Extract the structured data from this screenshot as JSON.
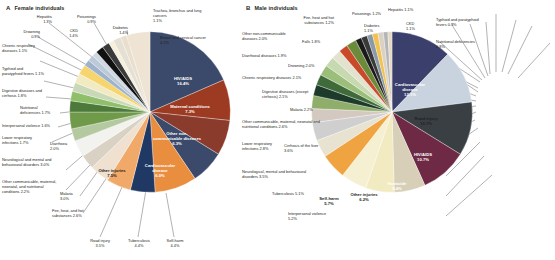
{
  "figure": {
    "panels": [
      {
        "letter": "A",
        "title": "Female individuals",
        "inner_labels": [
          {
            "name": "HIV/AIDS",
            "value": "16.4%"
          },
          {
            "name": "Maternal conditions",
            "value": "7.3%"
          },
          {
            "name": "Other non-communicable diseases",
            "value": "6.3%"
          },
          {
            "name": "Cardiovascular disease",
            "value": "6.0%"
          },
          {
            "name": "Other injuries",
            "value": "7.5%"
          }
        ],
        "outer_labels": [
          {
            "name": "Hepatitis",
            "value": "1.3%"
          },
          {
            "name": "Poisonings",
            "value": "0.9%"
          },
          {
            "name": "Trachea, bronchus and lung cancers",
            "value": "1.1%"
          },
          {
            "name": "Diabetes",
            "value": "1.4%"
          },
          {
            "name": "Breast and cervical cancer",
            "value": "4.2%"
          },
          {
            "name": "CKD",
            "value": "1.4%"
          },
          {
            "name": "Drowning",
            "value": "0.9%"
          },
          {
            "name": "Chronic respiratory diseases",
            "value": "1.1%"
          },
          {
            "name": "Typhoid and paratyphoid fevers",
            "value": "1.1%"
          },
          {
            "name": "Digestive diseases and cirrhosis",
            "value": "1.8%"
          },
          {
            "name": "Nutritional deficiencies",
            "value": "1.7%"
          },
          {
            "name": "Interpersonal violence",
            "value": "1.6%"
          },
          {
            "name": "Lower respiratory infections",
            "value": "1.7%"
          },
          {
            "name": "Diarrhoea",
            "value": "2.0%"
          },
          {
            "name": "Neurological and mental and behavioural disorders",
            "value": "3.0%"
          },
          {
            "name": "Other communicable, maternal, neonatal, and nutritional conditions",
            "value": "2.2%"
          },
          {
            "name": "Malaria",
            "value": "3.0%"
          },
          {
            "name": "Fire, heat, and hot substances",
            "value": "2.6%"
          },
          {
            "name": "Road injury",
            "value": "3.5%"
          },
          {
            "name": "Tuberculosis",
            "value": "4.4%"
          },
          {
            "name": "Self-harm",
            "value": "4.4%"
          }
        ]
      },
      {
        "letter": "B",
        "title": "Male individuals",
        "inner_labels": [
          {
            "name": "Cardiovascular disease",
            "value": "12.1%"
          },
          {
            "name": "Road injury",
            "value": "10.7%"
          },
          {
            "name": "HIV/AIDS",
            "value": "10.7%"
          },
          {
            "name": "Homicide",
            "value": "9.4%"
          },
          {
            "name": "Other injuries",
            "value": "6.2%"
          },
          {
            "name": "Self-harm",
            "value": "5.7%"
          }
        ],
        "outer_labels": [
          {
            "name": "Fire, heat and hot substances",
            "value": "1.2%"
          },
          {
            "name": "Poisonings",
            "value": "1.2%"
          },
          {
            "name": "Hepatitis",
            "value": "1.1%"
          },
          {
            "name": "Typhoid and paratyphoid fevers",
            "value": "0.9%"
          },
          {
            "name": "Diabetes",
            "value": "1.1%"
          },
          {
            "name": "CKD",
            "value": "1.1%"
          },
          {
            "name": "Nutritional deficiencies",
            "value": "0.8%"
          },
          {
            "name": "Other non-communicable diseases",
            "value": "2.0%"
          },
          {
            "name": "Falls",
            "value": "1.8%"
          },
          {
            "name": "Diarrhoeal diseases",
            "value": "1.9%"
          },
          {
            "name": "Drowning",
            "value": "2.0%"
          },
          {
            "name": "Chronic respiratory diseases",
            "value": "2.1%"
          },
          {
            "name": "Digestive diseases (except cirrhosis)",
            "value": "2.1%"
          },
          {
            "name": "Malaria",
            "value": "2.2%"
          },
          {
            "name": "Other communicable, maternal, neonatal and nutritional conditions",
            "value": "2.6%"
          },
          {
            "name": "Lower respiratory infections",
            "value": "2.8%"
          },
          {
            "name": "Cirrhosis of the liver",
            "value": "3.6%"
          },
          {
            "name": "Neurological, mental and behavioural disorders",
            "value": "3.5%"
          },
          {
            "name": "Tuberculosis",
            "value": "5.1%"
          },
          {
            "name": "Interpersonal violence",
            "value": "5.2%"
          }
        ]
      }
    ]
  },
  "chart_data": [
    {
      "type": "pie",
      "title": "A Female individuals",
      "xlabel": "",
      "ylabel": "",
      "legend": "none",
      "categories": [
        "HIV/AIDS",
        "Maternal conditions",
        "Other non-communicable diseases",
        "Cardiovascular disease",
        "Other injuries",
        "Self-harm",
        "Tuberculosis",
        "Road injury",
        "Fire, heat, and hot substances",
        "Malaria",
        "Other communicable, maternal, neonatal, and nutritional conditions",
        "Neurological and mental and behavioural disorders",
        "Diarrhoea",
        "Lower respiratory infections",
        "Interpersonal violence",
        "Nutritional deficiencies",
        "Digestive diseases and cirrhosis",
        "Typhoid and paratyphoid fevers",
        "Chronic respiratory diseases",
        "Drowning",
        "CKD",
        "Hepatitis",
        "Poisonings",
        "Diabetes",
        "Trachea, bronchus and lung cancers",
        "Breast and cervical cancer"
      ],
      "values": [
        16.4,
        7.3,
        6.3,
        6.0,
        7.5,
        4.4,
        4.4,
        3.5,
        2.6,
        3.0,
        2.2,
        3.0,
        2.0,
        1.7,
        1.6,
        1.7,
        1.8,
        1.1,
        1.1,
        0.9,
        1.4,
        1.3,
        0.9,
        1.4,
        1.1,
        4.2
      ],
      "colors": [
        "#3b4a6b",
        "#9c3a22",
        "#8a3b2c",
        "#3b4a6b",
        "#e98d3f",
        "#1f3864",
        "#f0a968",
        "#efe0cf",
        "#d9d2c4",
        "#f2f2ef",
        "#b5c9a0",
        "#6f9a4a",
        "#4d7a3a",
        "#8fbf6a",
        "#c9d9b8",
        "#f2eac0",
        "#f7d56e",
        "#9db3cc",
        "#bcc9d6",
        "#cfd8e0",
        "#111111",
        "#3a3a3a",
        "#f6efdc",
        "#e4e0d4",
        "#eadfce",
        "#efe3d3"
      ]
    },
    {
      "type": "pie",
      "title": "B Male individuals",
      "xlabel": "",
      "ylabel": "",
      "legend": "none",
      "categories": [
        "Cardiovascular disease",
        "Road injury",
        "HIV/AIDS",
        "Homicide",
        "Other injuries",
        "Self-harm",
        "Interpersonal violence",
        "Tuberculosis",
        "Neurological, mental and behavioural disorders",
        "Cirrhosis of the liver",
        "Lower respiratory infections",
        "Other communicable, maternal, neonatal and nutritional conditions",
        "Malaria",
        "Digestive diseases (except cirrhosis)",
        "Chronic respiratory diseases",
        "Drowning",
        "Diarrhoeal diseases",
        "Falls",
        "Other non-communicable diseases",
        "Fire, heat and hot substances",
        "Poisonings",
        "Hepatitis",
        "CKD",
        "Diabetes",
        "Typhoid and paratyphoid fevers",
        "Nutritional deficiencies"
      ],
      "values": [
        12.1,
        10.7,
        10.7,
        9.4,
        6.2,
        5.7,
        5.2,
        5.1,
        3.5,
        3.6,
        2.8,
        2.6,
        2.2,
        2.1,
        2.1,
        2.0,
        1.9,
        1.8,
        2.0,
        1.2,
        1.2,
        1.1,
        1.1,
        1.1,
        0.9,
        0.8
      ],
      "colors": [
        "#3b3f6b",
        "#c9d3e0",
        "#3a3f44",
        "#6e2a44",
        "#d8cfb8",
        "#f2eac0",
        "#f6f0d2",
        "#f0a341",
        "#e8e2d0",
        "#cfcfcf",
        "#d4c9c0",
        "#8fae6a",
        "#1d3a2a",
        "#3f6b3a",
        "#9bbf7a",
        "#c7d9b0",
        "#e2e2cf",
        "#c94a2a",
        "#6b8a3a",
        "#1a1a1a",
        "#3a3a3a",
        "#8a9aa8",
        "#f2c14e",
        "#d9d2c4",
        "#b5b5b5",
        "#e4d9c4"
      ]
    }
  ]
}
